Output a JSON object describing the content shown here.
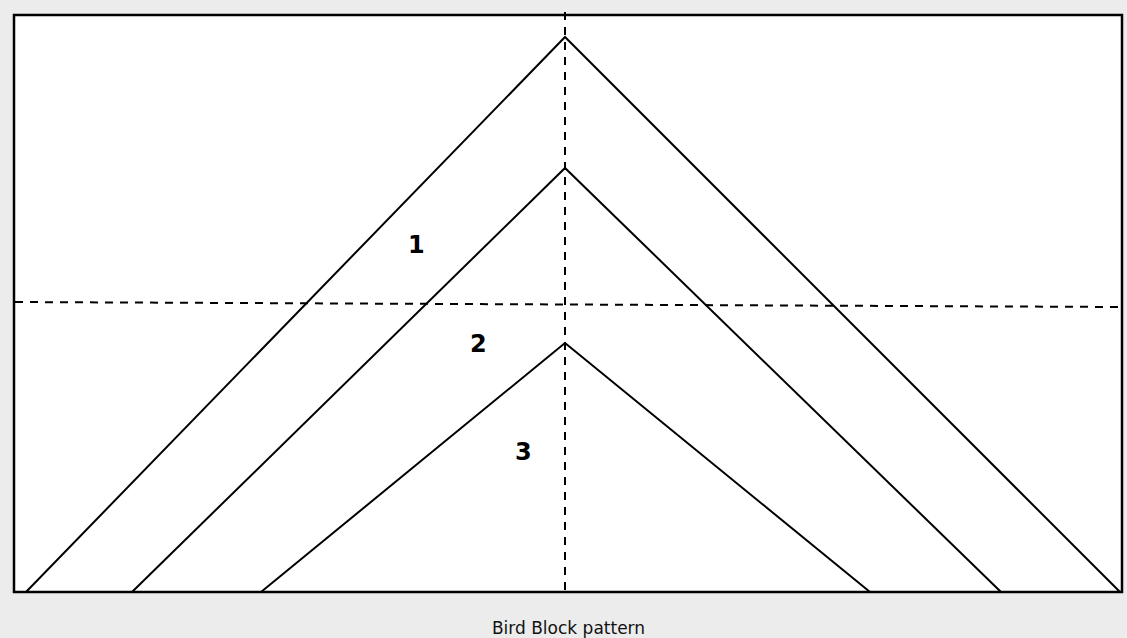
{
  "diagram": {
    "title": "Bird Block pattern",
    "colors": {
      "background": "#ececec",
      "block_fill": "#ffffff",
      "line": "#000000"
    },
    "frame": {
      "x": 14,
      "y": 15,
      "width": 1108,
      "height": 577
    },
    "guides": {
      "vertical_center": {
        "x": 565,
        "y1": 12,
        "y2": 592,
        "style": "dashed"
      },
      "horizontal_center": {
        "x1": 14,
        "y1": 302,
        "x2": 1122,
        "y2": 307,
        "style": "dashed"
      }
    },
    "chevrons": [
      {
        "id": 1,
        "peak": [
          565,
          37
        ],
        "base_left": [
          26,
          592
        ],
        "base_right": [
          1120,
          592
        ]
      },
      {
        "id": 2,
        "peak": [
          565,
          168
        ],
        "base_left": [
          132,
          592
        ],
        "base_right": [
          1001,
          592
        ]
      },
      {
        "id": 3,
        "peak": [
          565,
          343
        ],
        "base_left": [
          261,
          592
        ],
        "base_right": [
          870,
          592
        ]
      }
    ],
    "piece_labels": [
      {
        "text": "1",
        "x": 415,
        "y": 245
      },
      {
        "text": "2",
        "x": 478,
        "y": 343
      },
      {
        "text": "3",
        "x": 523,
        "y": 451
      }
    ]
  }
}
